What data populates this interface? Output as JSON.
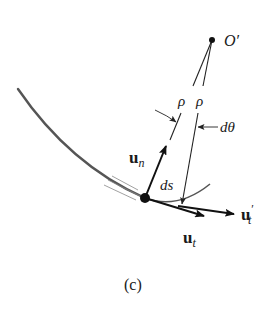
{
  "figure": {
    "caption": "(c)",
    "labels": {
      "center_point": "O′",
      "radius_left": "ρ",
      "radius_right": "ρ",
      "angle": "dθ",
      "arc_length": "ds",
      "normal_vector": {
        "base": "u",
        "sub": "n"
      },
      "tangent_vector": {
        "base": "u",
        "sub": "t"
      },
      "tangent_vector_prime": {
        "base": "u",
        "sub": "t",
        "sup": "′"
      }
    },
    "colors": {
      "curve": "#555555",
      "vector": "#111111",
      "line": "#222222",
      "background": "#ffffff"
    }
  }
}
